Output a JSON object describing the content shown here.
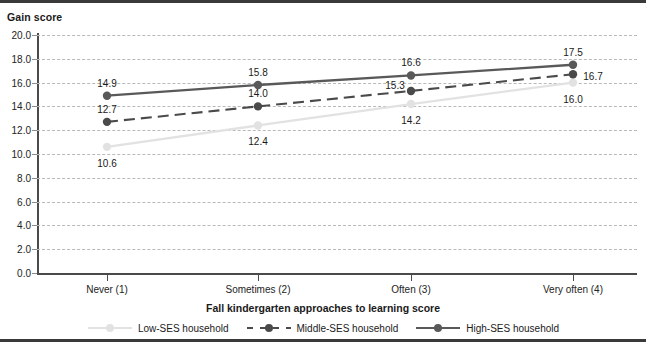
{
  "chart_data": {
    "type": "line",
    "title": "",
    "ylabel": "Gain score",
    "xlabel": "Fall kindergarten approaches to learning score",
    "categories": [
      "Never (1)",
      "Sometimes (2)",
      "Often (3)",
      "Very often (4)"
    ],
    "ylim": [
      0.0,
      20.0
    ],
    "ytick_labels": [
      "0.0",
      "2.0",
      "4.0",
      "6.0",
      "8.0",
      "10.0",
      "12.0",
      "14.0",
      "16.0",
      "18.0",
      "20.0"
    ],
    "ytick_values": [
      0,
      2,
      4,
      6,
      8,
      10,
      12,
      14,
      16,
      18,
      20
    ],
    "grid": true,
    "legend_position": "bottom",
    "series": [
      {
        "name": "Low-SES household",
        "color": "#e2e2e2",
        "style": "solid",
        "marker": "circle",
        "values": [
          10.6,
          12.4,
          14.2,
          16.0
        ],
        "labels": [
          "10.6",
          "12.4",
          "14.2",
          "16.0"
        ]
      },
      {
        "name": "Middle-SES household",
        "color": "#4a4a4a",
        "style": "dashed",
        "marker": "circle",
        "values": [
          12.7,
          14.0,
          15.3,
          16.7
        ],
        "labels": [
          "12.7",
          "14.0",
          "15.3",
          "16.7"
        ]
      },
      {
        "name": "High-SES household",
        "color": "#595959",
        "style": "solid",
        "marker": "circle",
        "values": [
          14.9,
          15.8,
          16.6,
          17.5
        ],
        "labels": [
          "14.9",
          "15.8",
          "16.6",
          "17.5"
        ]
      }
    ],
    "point_label_offsets": [
      [
        [
          0,
          16
        ],
        [
          0,
          16
        ],
        [
          0,
          16
        ],
        [
          0,
          16
        ]
      ],
      [
        [
          0,
          -13
        ],
        [
          0,
          -13
        ],
        [
          -16,
          -6
        ],
        [
          20,
          2
        ]
      ],
      [
        [
          0,
          -13
        ],
        [
          0,
          -13
        ],
        [
          0,
          -13
        ],
        [
          0,
          -13
        ]
      ]
    ]
  }
}
